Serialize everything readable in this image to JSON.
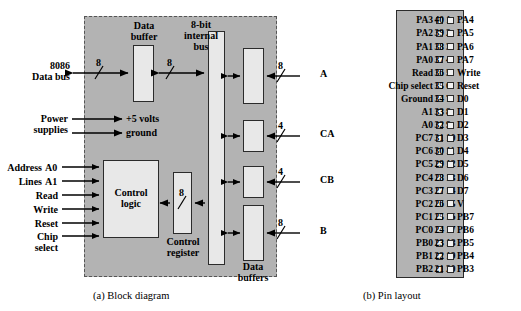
{
  "figure": {
    "captions": {
      "a": "(a) Block diagram",
      "b": "(b) Pin layout"
    },
    "colors": {
      "chip_fill": "#b3b3b3",
      "box_fill": "#e8e8e8",
      "stroke": "#2b2b2b",
      "dashed_border": "#555555",
      "background": "#ffffff"
    }
  },
  "block_diagram": {
    "blocks": [
      {
        "id": "data-buffer",
        "label_line1": "Data",
        "label_line2": "buffer"
      },
      {
        "id": "internal-bus",
        "label_line1": "8-bit",
        "label_line2": "internal",
        "label_line3": "bus"
      },
      {
        "id": "control-logic",
        "label_line1": "Control",
        "label_line2": "logic"
      },
      {
        "id": "control-register",
        "label_line1": "Control",
        "label_line2": "register"
      },
      {
        "id": "data-buffers",
        "label_line1": "Data",
        "label_line2": "buffers"
      }
    ],
    "left_signals": [
      {
        "id": "data-bus",
        "line1": "8086",
        "line2": "Data bus"
      },
      {
        "id": "power",
        "line1": "Power",
        "line2": "supplies"
      },
      {
        "id": "address-a0",
        "line1": "Address",
        "line2": "A0"
      },
      {
        "id": "address-a1",
        "line1": "Lines",
        "line2": "A1"
      },
      {
        "id": "read",
        "line1": "Read",
        "line2": ""
      },
      {
        "id": "write",
        "line1": "Write",
        "line2": ""
      },
      {
        "id": "reset",
        "line1": "Reset",
        "line2": ""
      },
      {
        "id": "chip-select",
        "line1": "Chip",
        "line2": "select"
      }
    ],
    "power_outputs": [
      {
        "id": "volts",
        "label": "+5 volts"
      },
      {
        "id": "ground",
        "label": "ground"
      }
    ],
    "right_ports": [
      {
        "id": "port-a",
        "label": "A",
        "width": "8"
      },
      {
        "id": "port-ca",
        "label": "CA",
        "width": "4"
      },
      {
        "id": "port-cb",
        "label": "CB",
        "width": "4"
      },
      {
        "id": "port-b",
        "label": "B",
        "width": "8"
      }
    ],
    "bus_widths": {
      "external_data": "8",
      "buffer_to_bus": "8",
      "control_register": "8"
    }
  },
  "pin_layout": {
    "left_pins": [
      {
        "num": "1",
        "name": "PA3"
      },
      {
        "num": "2",
        "name": "PA2"
      },
      {
        "num": "3",
        "name": "PA1"
      },
      {
        "num": "4",
        "name": "PA0"
      },
      {
        "num": "5",
        "name": "Read"
      },
      {
        "num": "6",
        "name": "Chip select"
      },
      {
        "num": "7",
        "name": "Ground"
      },
      {
        "num": "8",
        "name": "A1"
      },
      {
        "num": "9",
        "name": "A0"
      },
      {
        "num": "10",
        "name": "PC7"
      },
      {
        "num": "11",
        "name": "PC6"
      },
      {
        "num": "12",
        "name": "PC5"
      },
      {
        "num": "13",
        "name": "PC4"
      },
      {
        "num": "14",
        "name": "PC3"
      },
      {
        "num": "15",
        "name": "PC2"
      },
      {
        "num": "16",
        "name": "PC1"
      },
      {
        "num": "17",
        "name": "PC0"
      },
      {
        "num": "18",
        "name": "PB0"
      },
      {
        "num": "19",
        "name": "PB1"
      },
      {
        "num": "20",
        "name": "PB2"
      }
    ],
    "right_pins": [
      {
        "num": "40",
        "name": "PA4"
      },
      {
        "num": "39",
        "name": "PA5"
      },
      {
        "num": "38",
        "name": "PA6"
      },
      {
        "num": "37",
        "name": "PA7"
      },
      {
        "num": "36",
        "name": "Write"
      },
      {
        "num": "35",
        "name": "Reset"
      },
      {
        "num": "34",
        "name": "D0"
      },
      {
        "num": "33",
        "name": "D1"
      },
      {
        "num": "32",
        "name": "D2"
      },
      {
        "num": "31",
        "name": "D3"
      },
      {
        "num": "30",
        "name": "D4"
      },
      {
        "num": "29",
        "name": "D5"
      },
      {
        "num": "28",
        "name": "D6"
      },
      {
        "num": "27",
        "name": "D7"
      },
      {
        "num": "26",
        "name": "V"
      },
      {
        "num": "25",
        "name": "PB7"
      },
      {
        "num": "24",
        "name": "PB6"
      },
      {
        "num": "23",
        "name": "PB5"
      },
      {
        "num": "22",
        "name": "PB4"
      },
      {
        "num": "21",
        "name": "PB3"
      }
    ]
  }
}
